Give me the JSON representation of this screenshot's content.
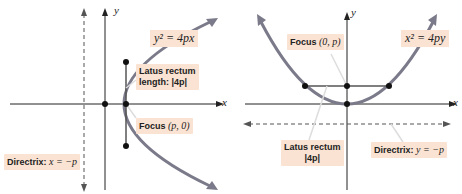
{
  "colors": {
    "curve": "#7a7a8a",
    "axis": "#222222",
    "directrix": "#555555",
    "label_bg": "#fbe3d3",
    "point": "#111111",
    "leader": "#dddddd"
  },
  "left": {
    "title": "Horizontal parabola",
    "axis_x": "x",
    "axis_y": "y",
    "equation": "y² = 4px",
    "latus_line1": "Latus rectum",
    "latus_line2": "length: |4p|",
    "focus_label": "Focus",
    "focus_coords": "(p, 0)",
    "directrix_label": "Directrix:",
    "directrix_eq": "x = −p"
  },
  "right": {
    "title": "Vertical parabola",
    "axis_x": "x",
    "axis_y": "y",
    "equation": "x² = 4py",
    "focus_label": "Focus",
    "focus_coords": "(0, p)",
    "latus_line1": "Latus rectum",
    "latus_line2": "|4p|",
    "directrix_label": "Directrix:",
    "directrix_eq": "y = −p"
  }
}
